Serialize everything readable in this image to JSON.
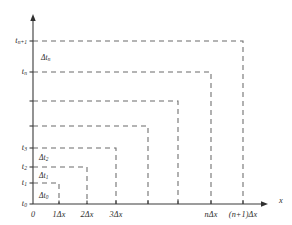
{
  "figure": {
    "background_color": "#ffffff",
    "axis_color": "#3a3a3a",
    "dash_color": "#6b6b6b"
  },
  "axes": {
    "x_axis_name": "x",
    "y_axis_name": "",
    "origin_label": "0"
  },
  "y_ticks": [
    {
      "id": "t0",
      "label_main": "t",
      "label_sub": "0",
      "y": 204
    },
    {
      "id": "t1",
      "label_main": "t",
      "label_sub": "1",
      "y": 183
    },
    {
      "id": "t2",
      "label_main": "t",
      "label_sub": "2",
      "y": 167
    },
    {
      "id": "t3",
      "label_main": "t",
      "label_sub": "3",
      "y": 148
    },
    {
      "id": "tu1",
      "label_main": "",
      "label_sub": "",
      "y": 126
    },
    {
      "id": "tu2",
      "label_main": "",
      "label_sub": "",
      "y": 101
    },
    {
      "id": "tn",
      "label_main": "t",
      "label_sub": "n",
      "y": 72
    },
    {
      "id": "tnp1",
      "label_main": "t",
      "label_sub": "n+1",
      "y": 41
    }
  ],
  "x_ticks": [
    {
      "id": "x0",
      "label": "0",
      "x": 33
    },
    {
      "id": "x1",
      "label": "1Δx",
      "x": 59
    },
    {
      "id": "x2",
      "label": "2Δx",
      "x": 87
    },
    {
      "id": "x3",
      "label": "3Δx",
      "x": 116
    },
    {
      "id": "x4",
      "label": "",
      "x": 148
    },
    {
      "id": "x5",
      "label": "",
      "x": 178
    },
    {
      "id": "xn",
      "label": "nΔx",
      "x": 211
    },
    {
      "id": "xnp1",
      "label": "(n+1)Δx",
      "x": 243
    }
  ],
  "dt_labels": [
    {
      "id": "dt0",
      "prefix": "Δt",
      "sub": "0",
      "x": 39,
      "y": 192
    },
    {
      "id": "dt1",
      "prefix": "Δt",
      "sub": "1",
      "x": 39,
      "y": 172
    },
    {
      "id": "dt2",
      "prefix": "Δt",
      "sub": "2",
      "x": 39,
      "y": 154
    },
    {
      "id": "dtn",
      "prefix": "Δt",
      "sub": "n",
      "x": 41,
      "y": 54
    }
  ],
  "steps": [
    {
      "id": "step-0",
      "top_y": 183,
      "right_x": 59,
      "label": "Δt0 over 1Δx"
    },
    {
      "id": "step-1",
      "top_y": 167,
      "right_x": 87,
      "label": "Δt1 over 2Δx"
    },
    {
      "id": "step-2",
      "top_y": 148,
      "right_x": 116,
      "label": "Δt2 over 3Δx"
    },
    {
      "id": "step-3",
      "top_y": 126,
      "right_x": 148,
      "label": "next step"
    },
    {
      "id": "step-4",
      "top_y": 101,
      "right_x": 178,
      "label": "next step"
    },
    {
      "id": "step-5",
      "top_y": 72,
      "right_x": 211,
      "label": "Δt n-1 over nΔx"
    },
    {
      "id": "step-6",
      "top_y": 41,
      "right_x": 243,
      "label": "Δtn over (n+1)Δx"
    }
  ],
  "geometry": {
    "axis_x": 33,
    "axis_y": 204,
    "y_axis_top": 14,
    "x_axis_right": 268,
    "tick_len": 3.5
  }
}
